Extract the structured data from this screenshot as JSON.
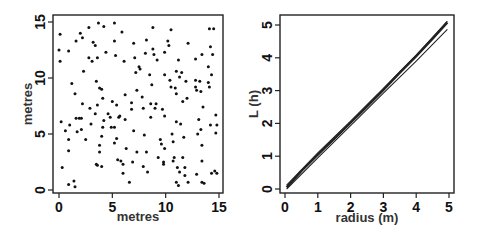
{
  "chart_data": [
    {
      "type": "scatter",
      "title": "",
      "xlabel": "metres",
      "ylabel": "metres",
      "xlim": [
        0,
        15
      ],
      "ylim": [
        0,
        15
      ],
      "xticks": [
        "0",
        "5",
        "10",
        "15"
      ],
      "yticks": [
        "0",
        "5",
        "10",
        "15"
      ],
      "grid": false,
      "legend": null,
      "points": [
        [
          0.0,
          12.5
        ],
        [
          0.1,
          13.9
        ],
        [
          0.1,
          11.5
        ],
        [
          0.2,
          6.1
        ],
        [
          0.3,
          2.0
        ],
        [
          0.6,
          5.3
        ],
        [
          0.9,
          0.5
        ],
        [
          0.9,
          12.4
        ],
        [
          0.9,
          4.5
        ],
        [
          0.9,
          3.5
        ],
        [
          1.0,
          5.8
        ],
        [
          1.2,
          9.5
        ],
        [
          1.4,
          0.8
        ],
        [
          1.5,
          8.6
        ],
        [
          1.5,
          0.3
        ],
        [
          1.6,
          13.3
        ],
        [
          1.6,
          6.4
        ],
        [
          1.7,
          5.2
        ],
        [
          1.9,
          6.4
        ],
        [
          2.0,
          14.0
        ],
        [
          2.1,
          5.4
        ],
        [
          2.1,
          6.4
        ],
        [
          2.2,
          13.6
        ],
        [
          2.2,
          7.7
        ],
        [
          2.3,
          10.6
        ],
        [
          2.5,
          4.5
        ],
        [
          2.8,
          14.5
        ],
        [
          2.8,
          11.8
        ],
        [
          2.9,
          7.3
        ],
        [
          3.0,
          5.9
        ],
        [
          3.1,
          11.5
        ],
        [
          3.2,
          13.2
        ],
        [
          3.4,
          6.8
        ],
        [
          3.4,
          12.9
        ],
        [
          3.5,
          2.3
        ],
        [
          3.5,
          9.7
        ],
        [
          3.6,
          7.6
        ],
        [
          3.6,
          11.8
        ],
        [
          3.6,
          2.2
        ],
        [
          3.7,
          14.9
        ],
        [
          3.8,
          3.4
        ],
        [
          3.8,
          9.1
        ],
        [
          3.8,
          4.0
        ],
        [
          4.0,
          4.8
        ],
        [
          4.0,
          9.0
        ],
        [
          4.1,
          8.2
        ],
        [
          4.1,
          5.6
        ],
        [
          4.2,
          6.2
        ],
        [
          4.0,
          2.1
        ],
        [
          4.2,
          14.6
        ],
        [
          4.4,
          12.3
        ],
        [
          4.6,
          6.8
        ],
        [
          4.8,
          6.5
        ],
        [
          4.9,
          5.6
        ],
        [
          5.0,
          7.9
        ],
        [
          5.2,
          14.9
        ],
        [
          5.2,
          13.3
        ],
        [
          5.2,
          5.6
        ],
        [
          5.2,
          4.2
        ],
        [
          5.3,
          12.0
        ],
        [
          5.4,
          7.6
        ],
        [
          5.4,
          4.6
        ],
        [
          5.5,
          2.7
        ],
        [
          5.6,
          6.5
        ],
        [
          5.7,
          6.6
        ],
        [
          5.8,
          2.6
        ],
        [
          5.9,
          14.1
        ],
        [
          6.0,
          2.3
        ],
        [
          6.0,
          1.5
        ],
        [
          6.1,
          11.5
        ],
        [
          6.2,
          8.5
        ],
        [
          6.2,
          6.3
        ],
        [
          6.3,
          3.7
        ],
        [
          6.6,
          0.7
        ],
        [
          6.8,
          7.8
        ],
        [
          6.8,
          7.2
        ],
        [
          6.9,
          2.5
        ],
        [
          7.0,
          13.1
        ],
        [
          7.0,
          5.3
        ],
        [
          7.1,
          11.8
        ],
        [
          7.2,
          10.5
        ],
        [
          7.3,
          8.9
        ],
        [
          7.3,
          3.4
        ],
        [
          7.5,
          11.0
        ],
        [
          7.6,
          10.8
        ],
        [
          7.8,
          8.3
        ],
        [
          7.9,
          7.3
        ],
        [
          7.9,
          2.1
        ],
        [
          8.0,
          4.9
        ],
        [
          8.1,
          12.2
        ],
        [
          8.2,
          13.4
        ],
        [
          8.2,
          3.4
        ],
        [
          8.3,
          1.6
        ],
        [
          8.5,
          10.3
        ],
        [
          8.6,
          6.5
        ],
        [
          8.6,
          7.7
        ],
        [
          8.7,
          9.4
        ],
        [
          8.8,
          12.6
        ],
        [
          8.8,
          14.5
        ],
        [
          8.9,
          12.1
        ],
        [
          9.0,
          7.3
        ],
        [
          9.1,
          7.7
        ],
        [
          9.2,
          11.6
        ],
        [
          9.3,
          2.9
        ],
        [
          9.5,
          4.5
        ],
        [
          9.6,
          4.1
        ],
        [
          9.7,
          7.2
        ],
        [
          9.8,
          2.5
        ],
        [
          9.8,
          2.3
        ],
        [
          9.9,
          3.7
        ],
        [
          9.9,
          12.3
        ],
        [
          9.9,
          10.3
        ],
        [
          9.9,
          6.6
        ],
        [
          10.2,
          13.3
        ],
        [
          10.3,
          12.9
        ],
        [
          10.4,
          9.8
        ],
        [
          10.5,
          14.3
        ],
        [
          10.5,
          9.2
        ],
        [
          10.6,
          5.0
        ],
        [
          10.7,
          4.3
        ],
        [
          10.7,
          2.6
        ],
        [
          10.8,
          2.9
        ],
        [
          10.9,
          9.1
        ],
        [
          11.0,
          10.6
        ],
        [
          11.0,
          8.6
        ],
        [
          11.0,
          0.7
        ],
        [
          11.0,
          6.1
        ],
        [
          11.1,
          2.0
        ],
        [
          11.2,
          0.4
        ],
        [
          11.2,
          11.6
        ],
        [
          11.3,
          10.1
        ],
        [
          11.3,
          1.6
        ],
        [
          11.4,
          5.9
        ],
        [
          11.5,
          10.5
        ],
        [
          11.6,
          2.9
        ],
        [
          11.6,
          7.9
        ],
        [
          11.7,
          4.7
        ],
        [
          11.8,
          1.3
        ],
        [
          11.8,
          2.0
        ],
        [
          11.9,
          9.7
        ],
        [
          12.0,
          8.2
        ],
        [
          12.1,
          13.1
        ],
        [
          12.1,
          0.7
        ],
        [
          12.8,
          11.7
        ],
        [
          12.8,
          9.8
        ],
        [
          12.8,
          9.2
        ],
        [
          12.9,
          8.9
        ],
        [
          13.0,
          5.0
        ],
        [
          12.9,
          1.4
        ],
        [
          13.1,
          6.3
        ],
        [
          13.2,
          9.7
        ],
        [
          13.3,
          8.8
        ],
        [
          13.3,
          5.4
        ],
        [
          13.4,
          12.1
        ],
        [
          13.4,
          4.0
        ],
        [
          13.4,
          2.6
        ],
        [
          13.5,
          7.4
        ],
        [
          13.4,
          0.7
        ],
        [
          13.6,
          0.6
        ],
        [
          14.0,
          11.0
        ],
        [
          14.0,
          9.6
        ],
        [
          14.1,
          9.2
        ],
        [
          14.1,
          14.4
        ],
        [
          14.2,
          12.8
        ],
        [
          14.2,
          5.8
        ],
        [
          14.3,
          10.3
        ],
        [
          14.3,
          1.5
        ],
        [
          14.5,
          14.4
        ],
        [
          14.4,
          12.1
        ],
        [
          14.6,
          1.7
        ],
        [
          14.7,
          6.7
        ],
        [
          14.7,
          5.1
        ],
        [
          14.8,
          5.8
        ],
        [
          14.8,
          1.5
        ]
      ]
    },
    {
      "type": "line",
      "title": "",
      "xlabel": "radius (m)",
      "ylabel": "L (h)",
      "xlim": [
        0,
        5
      ],
      "ylim": [
        0,
        5
      ],
      "xticks": [
        "0",
        "1",
        "2",
        "3",
        "4",
        "5"
      ],
      "yticks": [
        "0",
        "1",
        "2",
        "3",
        "4",
        "5"
      ],
      "grid": false,
      "legend": null,
      "series": [
        {
          "name": "L(h) observed",
          "x": [
            0.05,
            0.5,
            1.0,
            1.5,
            2.0,
            2.5,
            3.0,
            3.5,
            4.0,
            4.5,
            4.95
          ],
          "values": [
            0.05,
            0.55,
            1.05,
            1.53,
            2.02,
            2.52,
            3.02,
            3.55,
            4.05,
            4.58,
            5.08
          ]
        },
        {
          "name": "upper envelope",
          "x": [
            0.05,
            1.0,
            2.0,
            3.0,
            4.0,
            4.95
          ],
          "values": [
            0.12,
            1.1,
            2.07,
            3.07,
            4.08,
            5.12
          ]
        },
        {
          "name": "lower envelope",
          "x": [
            0.05,
            1.0,
            2.0,
            3.0,
            4.0,
            4.95
          ],
          "values": [
            0.0,
            0.95,
            1.93,
            2.92,
            3.9,
            4.87
          ]
        }
      ]
    }
  ]
}
